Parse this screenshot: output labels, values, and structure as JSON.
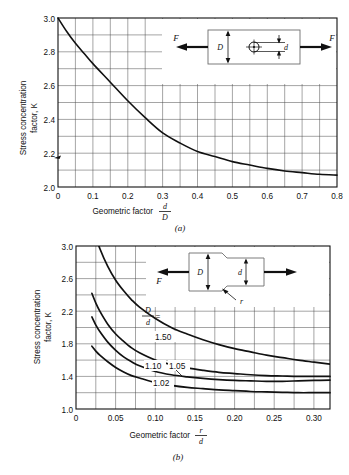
{
  "figure": {
    "background_color": "#ffffff",
    "line_color": "#111111",
    "grid_color": "#555555"
  },
  "chart_data": [
    {
      "type": "line",
      "id": "chart-a",
      "title": "",
      "caption": "(a)",
      "xlabel": "Geometric factor",
      "xlabel_fraction_numerator": "d",
      "xlabel_fraction_denominator": "D",
      "ylabel": "Stress concentration factor, K",
      "ylabel_line1": "Stress concentration",
      "ylabel_line2": "factor, K",
      "xlim": [
        0,
        0.8
      ],
      "ylim": [
        2.0,
        3.0
      ],
      "xticks": [
        0,
        0.1,
        0.2,
        0.3,
        0.4,
        0.5,
        0.6,
        0.7,
        0.8
      ],
      "xticklabels": [
        "0",
        "0.1",
        "0.2",
        "0.3",
        "0.4",
        "0.5",
        "0.6",
        "0.7",
        "0.8"
      ],
      "yticks": [
        2.0,
        2.2,
        2.4,
        2.6,
        2.8,
        3.0
      ],
      "yticklabels": [
        "2.0",
        "2.2",
        "2.4",
        "2.6",
        "2.8",
        "3.0"
      ],
      "grid": true,
      "grid_x_step": 0.05,
      "grid_y_step": 0.1,
      "legend": "none",
      "series": [
        {
          "name": "plate with central hole",
          "x": [
            0,
            0.025,
            0.05,
            0.075,
            0.1,
            0.15,
            0.2,
            0.25,
            0.3,
            0.35,
            0.4,
            0.45,
            0.5,
            0.55,
            0.6,
            0.65,
            0.7,
            0.75,
            0.8
          ],
          "values": [
            3.0,
            2.92,
            2.85,
            2.79,
            2.73,
            2.62,
            2.51,
            2.41,
            2.32,
            2.26,
            2.21,
            2.18,
            2.15,
            2.13,
            2.11,
            2.095,
            2.085,
            2.075,
            2.07
          ]
        }
      ],
      "inset": {
        "name": "flat plate with transverse hole in tension",
        "labels": [
          "F",
          "D",
          "d",
          "F"
        ]
      }
    },
    {
      "type": "line",
      "id": "chart-b",
      "title": "",
      "caption": "(b)",
      "xlabel": "Geometric factor",
      "xlabel_fraction_numerator": "r",
      "xlabel_fraction_denominator": "d",
      "ylabel": "Stress concentration factor, K",
      "ylabel_line1": "Stress concentration",
      "ylabel_line2": "factor, K",
      "xlim": [
        0,
        0.32
      ],
      "ylim": [
        1.0,
        3.0
      ],
      "xticks": [
        0,
        0.05,
        0.1,
        0.15,
        0.2,
        0.25,
        0.3
      ],
      "xticklabels": [
        "0",
        "0.05",
        "0.10",
        "0.15",
        "0.20",
        "0.25",
        "0.30"
      ],
      "yticks": [
        1.0,
        1.4,
        1.8,
        2.2,
        2.6,
        3.0
      ],
      "yticklabels": [
        "1.0",
        "1.4",
        "1.8",
        "2.2",
        "2.6",
        "3.0"
      ],
      "grid": true,
      "grid_x_step": 0.025,
      "grid_y_step": 0.2,
      "legend": "inline-curve-labels",
      "legend_key_numerator": "D",
      "legend_key_denominator": "d",
      "legend_key_equals": "=",
      "series": [
        {
          "name": "1.50",
          "label": "1.50",
          "x": [
            0.02,
            0.025,
            0.03,
            0.04,
            0.05,
            0.06,
            0.07,
            0.08,
            0.1,
            0.12,
            0.14,
            0.16,
            0.18,
            0.2,
            0.22,
            0.24,
            0.26,
            0.28,
            0.3,
            0.32
          ],
          "values": [
            3.3,
            3.12,
            2.97,
            2.75,
            2.58,
            2.45,
            2.34,
            2.25,
            2.11,
            2.0,
            1.92,
            1.85,
            1.79,
            1.74,
            1.7,
            1.66,
            1.63,
            1.6,
            1.575,
            1.55
          ]
        },
        {
          "name": "1.10",
          "label": "1.10",
          "x": [
            0.02,
            0.025,
            0.03,
            0.04,
            0.05,
            0.06,
            0.07,
            0.08,
            0.1,
            0.12,
            0.14,
            0.16,
            0.18,
            0.2,
            0.22,
            0.24,
            0.26,
            0.28,
            0.3,
            0.32
          ],
          "values": [
            2.42,
            2.3,
            2.2,
            2.04,
            1.92,
            1.83,
            1.75,
            1.69,
            1.6,
            1.545,
            1.505,
            1.475,
            1.45,
            1.435,
            1.42,
            1.41,
            1.405,
            1.4,
            1.4,
            1.4
          ]
        },
        {
          "name": "1.05",
          "label": "1.05",
          "x": [
            0.02,
            0.025,
            0.03,
            0.04,
            0.05,
            0.06,
            0.07,
            0.08,
            0.1,
            0.12,
            0.14,
            0.16,
            0.18,
            0.2,
            0.22,
            0.24,
            0.26,
            0.28,
            0.3,
            0.32
          ],
          "values": [
            2.13,
            2.03,
            1.95,
            1.82,
            1.72,
            1.64,
            1.58,
            1.53,
            1.46,
            1.42,
            1.395,
            1.375,
            1.36,
            1.35,
            1.345,
            1.34,
            1.34,
            1.345,
            1.35,
            1.355
          ]
        },
        {
          "name": "1.02",
          "label": "1.02",
          "x": [
            0.02,
            0.025,
            0.03,
            0.04,
            0.05,
            0.06,
            0.07,
            0.08,
            0.1,
            0.12,
            0.14,
            0.16,
            0.18,
            0.2,
            0.22,
            0.24,
            0.26,
            0.28,
            0.3,
            0.32
          ],
          "values": [
            1.77,
            1.71,
            1.66,
            1.58,
            1.51,
            1.455,
            1.41,
            1.38,
            1.325,
            1.29,
            1.265,
            1.25,
            1.235,
            1.225,
            1.215,
            1.21,
            1.205,
            1.2,
            1.2,
            1.2
          ]
        }
      ],
      "inset": {
        "name": "stepped shaft with fillet in tension",
        "labels": [
          "F",
          "D",
          "d",
          "r"
        ]
      }
    }
  ],
  "chart_a": {
    "ylabel_line1": "Stress concentration",
    "ylabel_line2": "factor, K",
    "xlabel_text": "Geometric factor",
    "frac_num": "d",
    "frac_den": "D",
    "caption": "(a)",
    "yticklabels": [
      "3.0",
      "2.8",
      "2.6",
      "2.4",
      "2.2",
      "2.0"
    ],
    "xticklabels": [
      "0",
      "0.1",
      "0.2",
      "0.3",
      "0.4",
      "0.5",
      "0.6",
      "0.7",
      "0.8"
    ],
    "inset": {
      "f_left": "F",
      "f_right": "F",
      "d_big": "D",
      "d_small": "d"
    }
  },
  "chart_b": {
    "ylabel_line1": "Stress concentration",
    "ylabel_line2": "factor, K",
    "xlabel_text": "Geometric factor",
    "frac_num": "r",
    "frac_den": "d",
    "caption": "(b)",
    "yticklabels": [
      "3.0",
      "2.6",
      "2.2",
      "1.8",
      "1.4",
      "1.0"
    ],
    "xticklabels": [
      "0",
      "0.05",
      "0.10",
      "0.15",
      "0.20",
      "0.25",
      "0.30"
    ],
    "key_num": "D",
    "key_den": "d",
    "key_eq": "=",
    "curve_labels": [
      "1.50",
      "1.10",
      "1.05",
      "1.02"
    ],
    "inset": {
      "f_left": "F",
      "d_big": "D",
      "d_small": "d",
      "r_label": "r"
    }
  }
}
